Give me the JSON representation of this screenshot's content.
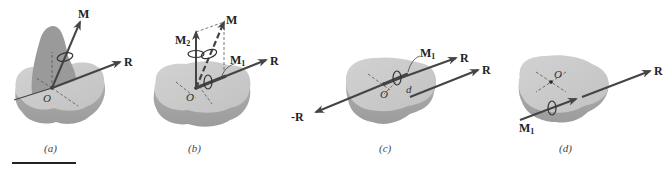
{
  "figure": {
    "panels": [
      {
        "id": "a",
        "caption": "(a)",
        "labels": {
          "moment": "M",
          "resultant": "R",
          "origin": "O"
        }
      },
      {
        "id": "b",
        "caption": "(b)",
        "labels": {
          "moment": "M",
          "moment2": "M",
          "moment2_sub": "2",
          "moment1": "M",
          "moment1_sub": "1",
          "resultant": "R",
          "origin": "O"
        }
      },
      {
        "id": "c",
        "caption": "(c)",
        "labels": {
          "moment1": "M",
          "moment1_sub": "1",
          "resultant_top": "R",
          "resultant_right": "R",
          "negative_resultant": "-R",
          "origin": "O",
          "distance": "d"
        }
      },
      {
        "id": "d",
        "caption": "(d)",
        "labels": {
          "origin": "O",
          "resultant": "R",
          "moment1": "M",
          "moment1_sub": "1"
        }
      }
    ],
    "colors": {
      "body_top": "#c9c9c9",
      "body_side": "#a9a9a9",
      "body_shadow": "#9a9a9a",
      "arrow": "#4a4a4a",
      "text": "#222222"
    }
  }
}
